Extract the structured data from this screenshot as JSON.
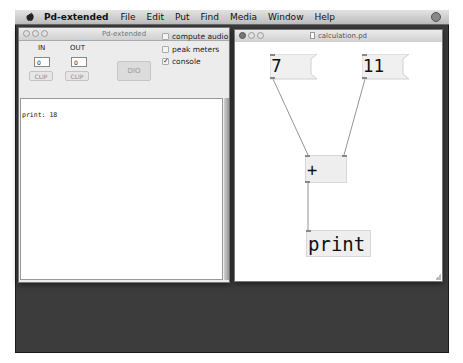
{
  "menubar": {
    "app_name": "Pd-extended",
    "items": [
      "File",
      "Edit",
      "Put",
      "Find",
      "Media",
      "Window",
      "Help"
    ]
  },
  "main_window": {
    "title": "Pd-extended",
    "in_label": "IN",
    "out_label": "OUT",
    "in_value": "0",
    "out_value": "0",
    "clip_in_label": "CLIP",
    "clip_out_label": "CLIP",
    "dio_label": "DIO",
    "checkboxes": [
      {
        "label": "compute audio",
        "checked": false
      },
      {
        "label": "peak meters",
        "checked": false
      },
      {
        "label": "console",
        "checked": true
      }
    ],
    "console_lines": [
      "print: 18"
    ]
  },
  "patch_window": {
    "title": "calculation.pd",
    "objects": {
      "msg_a": "7",
      "msg_b": "11",
      "add": "+",
      "print": "print"
    }
  },
  "colors": {
    "screen_bg": "#3c3c3c",
    "box_fill": "#eeeeee",
    "wire": "#777777"
  }
}
